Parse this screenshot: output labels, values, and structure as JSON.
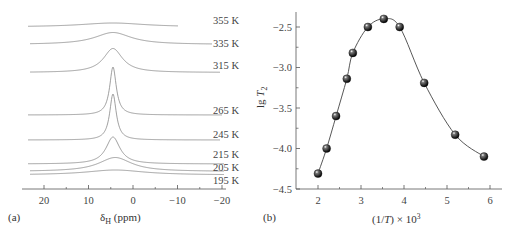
{
  "panels": {
    "a": {
      "label": "(a)",
      "xlabel_main": "δ",
      "xlabel_sub": "H",
      "xlabel_rest": " (ppm)",
      "xticks": [
        "20",
        "10",
        "0",
        "−10",
        "−20"
      ]
    },
    "b": {
      "label": "(b)",
      "ylabel_main": "lg ",
      "ylabel_var": "T",
      "ylabel_sub": "2",
      "xlabel_pre": "(1/",
      "xlabel_var": "T",
      "xlabel_post": ") × 10",
      "xlabel_sup": "3",
      "xticks": [
        "2",
        "3",
        "4",
        "5",
        "6"
      ],
      "yticks": [
        "−2.5",
        "−3.0",
        "−3.5",
        "−4.0",
        "−4.5"
      ]
    }
  },
  "chart_data": [
    {
      "type": "line",
      "title": "",
      "panel": "(a)",
      "xlabel": "δH (ppm)",
      "ylabel": "",
      "xlim": [
        25,
        -20
      ],
      "x_reversed": true,
      "grid": false,
      "description": "Stacked 1H NMR spectra at different temperatures; single peak near 4-5 ppm",
      "series": [
        {
          "name": "355 K",
          "peak_ppm": 4.5,
          "relative_peak_height": 0.1,
          "width": "very broad"
        },
        {
          "name": "335 K",
          "peak_ppm": 4.5,
          "relative_peak_height": 0.25,
          "width": "broad"
        },
        {
          "name": "315 K",
          "peak_ppm": 4.5,
          "relative_peak_height": 0.5,
          "width": "medium"
        },
        {
          "name": "265 K",
          "peak_ppm": 4.5,
          "relative_peak_height": 1.0,
          "width": "narrow"
        },
        {
          "name": "245 K",
          "peak_ppm": 4.5,
          "relative_peak_height": 0.95,
          "width": "narrow"
        },
        {
          "name": "215 K",
          "peak_ppm": 4.5,
          "relative_peak_height": 0.55,
          "width": "medium"
        },
        {
          "name": "205 K",
          "peak_ppm": 4.0,
          "relative_peak_height": 0.28,
          "width": "broad"
        },
        {
          "name": "195 K",
          "peak_ppm": 4.0,
          "relative_peak_height": 0.1,
          "width": "very broad"
        }
      ]
    },
    {
      "type": "scatter",
      "title": "",
      "panel": "(b)",
      "xlabel": "(1/T) × 10^3",
      "ylabel": "lg T2",
      "xlim": [
        1.6,
        6.2
      ],
      "ylim": [
        -4.5,
        -2.3
      ],
      "grid": false,
      "fit_line": "smooth curve through points",
      "x": [
        2.0,
        2.2,
        2.42,
        2.67,
        2.81,
        3.16,
        3.53,
        3.9,
        4.47,
        5.19,
        5.86
      ],
      "values": [
        -4.31,
        -4.0,
        -3.6,
        -3.14,
        -2.82,
        -2.5,
        -2.4,
        -2.5,
        -3.19,
        -3.83,
        -4.1
      ]
    }
  ]
}
